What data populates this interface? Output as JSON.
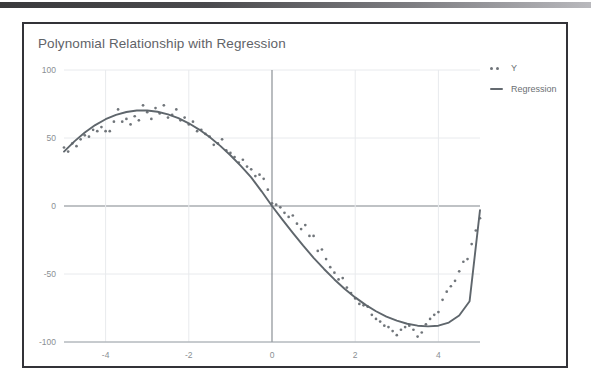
{
  "topbar": {
    "name": "window-top-bar"
  },
  "chart_data": {
    "type": "scatter",
    "title": "Polynomial Relationship with Regression",
    "xlabel": "",
    "ylabel": "",
    "xlim": [
      -5,
      5
    ],
    "ylim": [
      -100,
      100
    ],
    "grid": true,
    "legend_position": "right",
    "xticks": [
      -4,
      -2,
      0,
      2,
      4
    ],
    "yticks": [
      100,
      50,
      0,
      -50,
      -100
    ],
    "xtick_labels": [
      "-4",
      "-2",
      "0",
      "2",
      "4"
    ],
    "ytick_labels": [
      "100",
      "50",
      "0",
      "-50",
      "-100"
    ],
    "series": [
      {
        "name": "Y",
        "type": "scatter",
        "marker": "dot",
        "color": "#70757a",
        "x": [
          -5.0,
          -4.9,
          -4.8,
          -4.7,
          -4.6,
          -4.5,
          -4.4,
          -4.3,
          -4.2,
          -4.1,
          -4.0,
          -3.9,
          -3.8,
          -3.7,
          -3.6,
          -3.5,
          -3.4,
          -3.3,
          -3.2,
          -3.1,
          -3.0,
          -2.9,
          -2.8,
          -2.7,
          -2.6,
          -2.5,
          -2.4,
          -2.3,
          -2.2,
          -2.1,
          -2.0,
          -1.9,
          -1.8,
          -1.7,
          -1.6,
          -1.5,
          -1.4,
          -1.3,
          -1.2,
          -1.1,
          -1.0,
          -0.9,
          -0.8,
          -0.7,
          -0.6,
          -0.5,
          -0.4,
          -0.3,
          -0.2,
          -0.1,
          0.0,
          0.1,
          0.2,
          0.3,
          0.4,
          0.5,
          0.6,
          0.7,
          0.8,
          0.9,
          1.0,
          1.1,
          1.2,
          1.3,
          1.4,
          1.5,
          1.6,
          1.7,
          1.8,
          1.9,
          2.0,
          2.1,
          2.2,
          2.3,
          2.4,
          2.5,
          2.6,
          2.7,
          2.8,
          2.9,
          3.0,
          3.1,
          3.2,
          3.3,
          3.4,
          3.5,
          3.6,
          3.7,
          3.8,
          3.9,
          4.0,
          4.1,
          4.2,
          4.3,
          4.4,
          4.5,
          4.6,
          4.7,
          4.8,
          4.9,
          5.0
        ],
        "y": [
          43,
          40,
          46,
          44,
          49,
          52,
          51,
          56,
          55,
          58,
          55,
          55,
          62,
          71,
          62,
          64,
          60,
          66,
          63,
          74,
          69,
          64,
          72,
          68,
          74,
          65,
          67,
          71,
          63,
          65,
          60,
          62,
          55,
          56,
          53,
          51,
          45,
          46,
          49,
          41,
          39,
          36,
          32,
          34,
          29,
          27,
          22,
          23,
          20,
          12,
          2,
          1,
          -1,
          -5,
          -8,
          -7,
          -13,
          -17,
          -14,
          -22,
          -22,
          -33,
          -32,
          -39,
          -45,
          -49,
          -54,
          -53,
          -60,
          -64,
          -68,
          -72,
          -73,
          -74,
          -80,
          -83,
          -85,
          -88,
          -89,
          -92,
          -95,
          -91,
          -89,
          -88,
          -91,
          -96,
          -93,
          -87,
          -83,
          -80,
          -78,
          -69,
          -63,
          -59,
          -55,
          -48,
          -41,
          -39,
          -28,
          -18,
          -9
        ]
      },
      {
        "name": "Regression",
        "type": "line",
        "color": "#5f666c",
        "x": [
          -5.0,
          -4.75,
          -4.5,
          -4.25,
          -4.0,
          -3.75,
          -3.5,
          -3.25,
          -3.0,
          -2.75,
          -2.5,
          -2.25,
          -2.0,
          -1.75,
          -1.5,
          -1.25,
          -1.0,
          -0.75,
          -0.5,
          -0.25,
          0.0,
          0.25,
          0.5,
          0.75,
          1.0,
          1.25,
          1.5,
          1.75,
          2.0,
          2.25,
          2.5,
          2.75,
          3.0,
          3.25,
          3.5,
          3.75,
          4.0,
          4.25,
          4.5,
          4.75,
          5.0
        ],
        "y": [
          40.0,
          47.5,
          54.0,
          59.5,
          63.8,
          67.0,
          69.1,
          70.2,
          70.2,
          69.3,
          67.4,
          64.6,
          60.8,
          56.2,
          50.7,
          44.4,
          37.3,
          29.5,
          21.0,
          10.8,
          0.0,
          -10.0,
          -19.8,
          -29.2,
          -38.1,
          -46.3,
          -54.0,
          -61.0,
          -67.2,
          -72.7,
          -77.4,
          -81.3,
          -84.3,
          -86.6,
          -88.0,
          -88.5,
          -88.0,
          -85.7,
          -80.5,
          -70.0,
          -3.0
        ]
      }
    ]
  },
  "legend": {
    "items": [
      {
        "label": "Y",
        "key": "dots"
      },
      {
        "label": "Regression",
        "key": "line"
      }
    ]
  },
  "colors": {
    "axis": "#9aa0a6",
    "zero_axis": "#80868b",
    "grid": "#e8eaed",
    "title": "#5f6368",
    "tick": "#8a8f94",
    "series": "#70757a",
    "regression": "#5f666c",
    "panel_border": "#333338"
  }
}
